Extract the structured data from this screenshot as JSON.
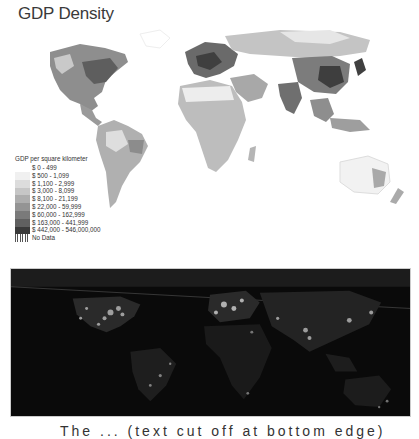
{
  "title": "GDP Density",
  "legend": {
    "heading": "GDP per square kilometer",
    "items": [
      {
        "label": "$ 0 - 499",
        "color": "#ffffff"
      },
      {
        "label": "$ 500 - 1,099",
        "color": "#f0f0f0"
      },
      {
        "label": "$ 1,100 - 2,999",
        "color": "#dcdcdc"
      },
      {
        "label": "$ 3,000 - 8,099",
        "color": "#c6c6c6"
      },
      {
        "label": "$ 8,100 - 21,199",
        "color": "#adadad"
      },
      {
        "label": "$ 22,000 - 59,999",
        "color": "#949494"
      },
      {
        "label": "$ 60,000 - 162,999",
        "color": "#7a7a7a"
      },
      {
        "label": "$ 163,000 - 441,999",
        "color": "#606060"
      },
      {
        "label": "$ 442,000 - 546,000,000",
        "color": "#3a3a3a"
      },
      {
        "label": "No Data",
        "color": "hatched"
      }
    ]
  },
  "maps": [
    {
      "name": "gdp-density-choropleth",
      "style": "grayscale"
    },
    {
      "name": "nighttime-lights",
      "style": "dark satellite"
    }
  ],
  "caption": {
    "text": "The ... (text cut off at bottom edge)"
  }
}
